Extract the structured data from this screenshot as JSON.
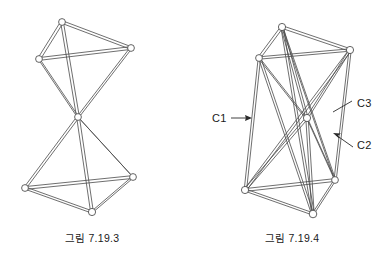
{
  "page": {
    "background_color": "#ffffff",
    "line_color": "#4a4a4a",
    "text_color": "#1a1a1a",
    "width": 385,
    "height": 262
  },
  "figures": [
    {
      "id": "figure-7-19-3",
      "caption": "그림 7.19.3",
      "description": "two-tetrahedron stack joined at a single central node",
      "labels": []
    },
    {
      "id": "figure-7-19-4",
      "caption": "그림 7.19.4",
      "description": "twisted prism tensegrity module with three labelled member groups",
      "labels": [
        {
          "name": "C1",
          "text": "C1"
        },
        {
          "name": "C2",
          "text": "C2"
        },
        {
          "name": "C3",
          "text": "C3"
        }
      ]
    }
  ],
  "captions": {
    "left": "그림 7.19.3",
    "right": "그림 7.19.4"
  },
  "member_labels": {
    "c1": "C1",
    "c2": "C2",
    "c3": "C3"
  },
  "geometry": {
    "figure_left": {
      "nodes": {
        "top": [
          62,
          22
        ],
        "upper_right": [
          131,
          48
        ],
        "upper_left": [
          39,
          59
        ],
        "center": [
          78,
          117
        ],
        "lower_left": [
          25,
          188
        ],
        "lower_right": [
          133,
          177
        ],
        "bottom": [
          92,
          212
        ]
      }
    },
    "figure_right": {
      "nodes": {
        "top": [
          282,
          27
        ],
        "upper_right": [
          350,
          50
        ],
        "upper_left": [
          259,
          58
        ],
        "center": [
          307,
          118
        ],
        "lower_left": [
          245,
          190
        ],
        "lower_right": [
          335,
          180
        ],
        "bottom": [
          313,
          214
        ]
      }
    }
  }
}
